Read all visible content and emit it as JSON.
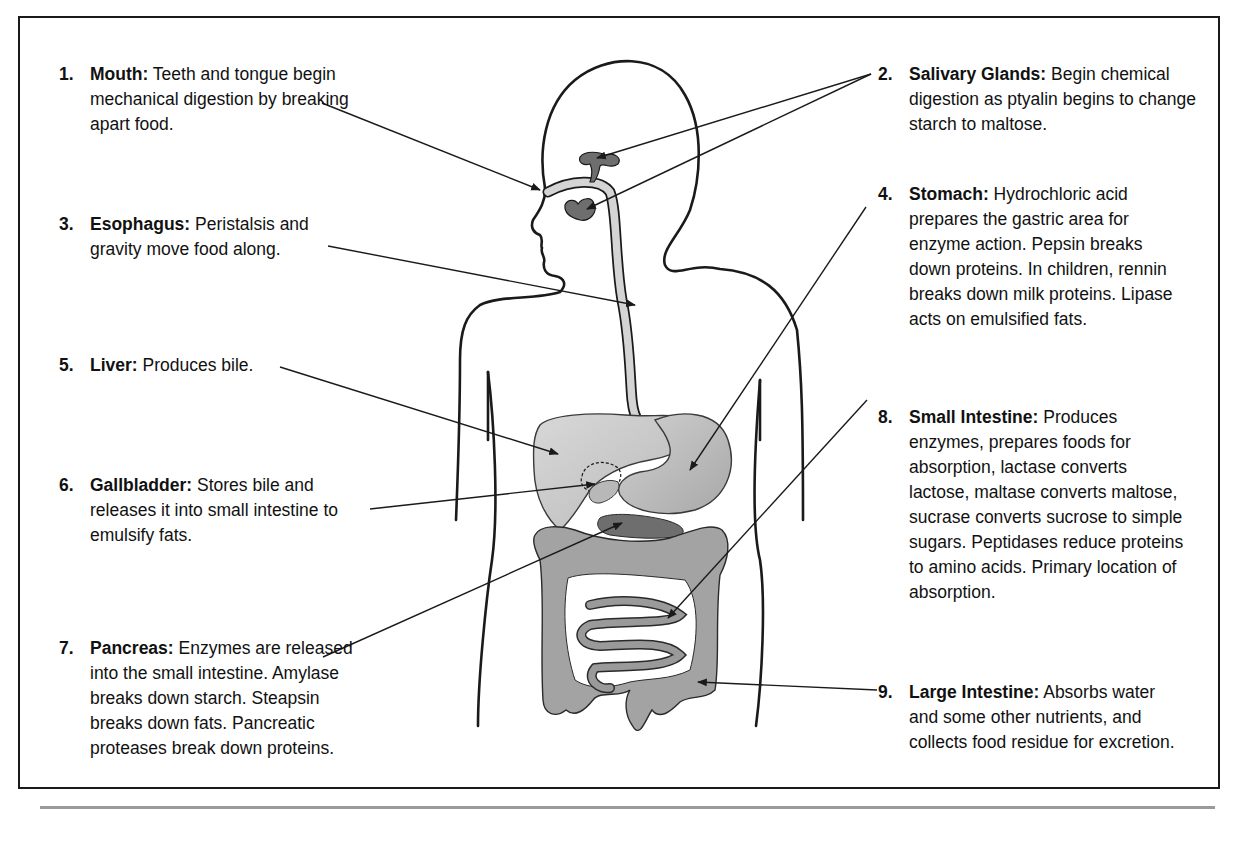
{
  "diagram": {
    "labels": [
      {
        "num": "1.",
        "title": "Mouth:",
        "text": "Teeth and tongue begin mechanical digestion by breaking apart food.",
        "lines": [
          "Teeth and tongue begin",
          "mechanical digestion by",
          "breaking apart food."
        ]
      },
      {
        "num": "2.",
        "title": "Salivary Glands:",
        "text": "Begin chemical digestion as ptyalin begins to change starch to maltose.",
        "lines": [
          "Begin chemical",
          "digestion as ptyalin begins to",
          "change starch to maltose."
        ]
      },
      {
        "num": "3.",
        "title": "Esophagus:",
        "text": "Peristalsis and gravity move food along.",
        "lines": [
          "Peristalsis and",
          "gravity move food along."
        ]
      },
      {
        "num": "4.",
        "title": "Stomach:",
        "text": "Hydrochloric acid prepares the gastric area for enzyme action. Pepsin breaks down proteins. In children, rennin breaks down milk proteins. Lipase acts on emulsified fats.",
        "lines": [
          "Hydrochloric acid",
          "prepares the gastric area for",
          "enzyme action. Pepsin breaks",
          "down proteins. In children,",
          "rennin breaks down milk",
          "proteins. Lipase acts on",
          "emulsified fats."
        ]
      },
      {
        "num": "5.",
        "title": "Liver:",
        "text": "Produces bile.",
        "lines": [
          "Produces bile."
        ]
      },
      {
        "num": "6.",
        "title": "Gallbladder:",
        "text": "Stores bile and releases it into small intestine to emulsify fats.",
        "lines": [
          "Stores bile and",
          "releases it into small intestine",
          "to emulsify fats."
        ]
      },
      {
        "num": "7.",
        "title": "Pancreas:",
        "text": "Enzymes are released into the small intestine. Amylase breaks down starch. Steapsin breaks down fats. Pancreatic proteases break down proteins.",
        "lines": [
          "Enzymes are",
          "released into the small",
          "intestine. Amylase breaks",
          "down starch. Steapsin breaks",
          "down fats. Pancreatic proteases",
          "break down proteins."
        ]
      },
      {
        "num": "8.",
        "title": "Small Intestine:",
        "text": "Produces enzymes, prepares foods for absorption, lactase converts lactose, maltase converts maltose, sucrase converts sucrose to simple sugars. Peptidases reduce proteins to amino acids. Primary location of absorption.",
        "lines": [
          "Produces",
          "enzymes, prepares foods for",
          "absorption, lactase converts",
          "lactose, maltase converts",
          "maltose, sucrase converts",
          "sucrose to simple sugars.",
          "Peptidases reduce proteins to",
          "amino acids. Primary location",
          "of absorption."
        ]
      },
      {
        "num": "9.",
        "title": "Large Intestine:",
        "text": "Absorbs water and some other nutrients, and collects food residue for excretion.",
        "lines": [
          "Absorbs",
          "water and some other",
          "nutrients, and collects food",
          "residue for excretion."
        ]
      }
    ],
    "colors": {
      "outline": "#1a1a1a",
      "organ_light": "#cfcfcf",
      "organ_mid": "#a9a9a9",
      "organ_dark": "#6e6e6e",
      "rule": "#9a9a9a"
    }
  }
}
